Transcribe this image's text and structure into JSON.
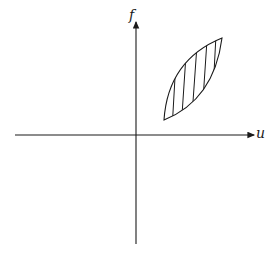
{
  "diagram": {
    "axes": {
      "horizontal_label": "u",
      "vertical_label": "f"
    },
    "region": {
      "description": "hatched lens-shaped hysteresis region in first quadrant",
      "fill": "vertical hatching"
    },
    "colors": {
      "stroke": "#1a1a1a",
      "background": "#ffffff"
    }
  }
}
